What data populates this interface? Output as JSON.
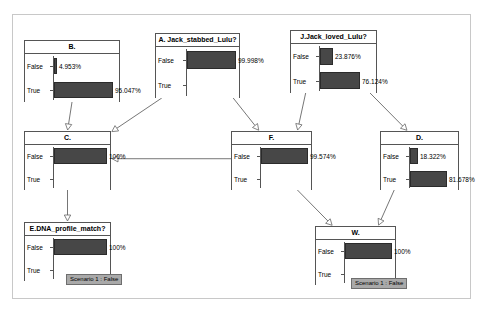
{
  "diagram": {
    "type": "bayesian-network",
    "title": "",
    "row_labels": [
      "False",
      "True"
    ],
    "bar_color": "#474747",
    "edge_color": "#666666",
    "frame_color": "#c8c8c8"
  },
  "nodes": [
    {
      "id": "B",
      "title": "B.",
      "x": 24,
      "y": 40,
      "w": 96,
      "h": 62,
      "axis_x": 28,
      "states": [
        {
          "label": "False",
          "value": 4.953,
          "value_text": "4.953%"
        },
        {
          "label": "True",
          "value": 95.047,
          "value_text": "95.047%"
        }
      ],
      "badge": null
    },
    {
      "id": "A",
      "title": "A. Jack_stabbed_Lulu?",
      "x": 155,
      "y": 33,
      "w": 85,
      "h": 65,
      "axis_x": 30,
      "states": [
        {
          "label": "False",
          "value": 99.998,
          "value_text": "99.998%"
        },
        {
          "label": "True",
          "value": 0.002,
          "value_text": ""
        }
      ],
      "badge": null
    },
    {
      "id": "J",
      "title": "J.Jack_loved_Lulu?",
      "x": 290,
      "y": 30,
      "w": 87,
      "h": 63,
      "axis_x": 28,
      "states": [
        {
          "label": "False",
          "value": 23.876,
          "value_text": "23.876%"
        },
        {
          "label": "True",
          "value": 76.124,
          "value_text": "76.124%"
        }
      ],
      "badge": null
    },
    {
      "id": "C",
      "title": "C.",
      "x": 24,
      "y": 131,
      "w": 87,
      "h": 59,
      "axis_x": 28,
      "states": [
        {
          "label": "False",
          "value": 100,
          "value_text": "100%"
        },
        {
          "label": "True",
          "value": 0,
          "value_text": ""
        }
      ],
      "badge": null
    },
    {
      "id": "F",
      "title": "F.",
      "x": 231,
      "y": 131,
      "w": 81,
      "h": 59,
      "axis_x": 28,
      "states": [
        {
          "label": "False",
          "value": 99.574,
          "value_text": "99.574%"
        },
        {
          "label": "True",
          "value": 0.426,
          "value_text": ""
        }
      ],
      "badge": null
    },
    {
      "id": "D",
      "title": "D.",
      "x": 380,
      "y": 131,
      "w": 79,
      "h": 59,
      "axis_x": 28,
      "states": [
        {
          "label": "False",
          "value": 18.322,
          "value_text": "18.322%"
        },
        {
          "label": "True",
          "value": 81.678,
          "value_text": "81.678%"
        }
      ],
      "badge": null
    },
    {
      "id": "E",
      "title": "E.DNA_profile_match?",
      "x": 24,
      "y": 222,
      "w": 87,
      "h": 59,
      "axis_x": 28,
      "states": [
        {
          "label": "False",
          "value": 100,
          "value_text": "100%"
        },
        {
          "label": "True",
          "value": 0,
          "value_text": ""
        }
      ],
      "badge": {
        "text": "Scenario 1 : False",
        "x": 42,
        "y": 52
      }
    },
    {
      "id": "W",
      "title": "W.",
      "x": 315,
      "y": 226,
      "w": 81,
      "h": 59,
      "axis_x": 28,
      "states": [
        {
          "label": "False",
          "value": 100,
          "value_text": "100%"
        },
        {
          "label": "True",
          "value": 0,
          "value_text": ""
        }
      ],
      "badge": {
        "text": "Scenario 1 : False",
        "x": 36,
        "y": 52
      }
    }
  ],
  "edges": [
    {
      "from": "B",
      "to": "C",
      "label": ""
    },
    {
      "from": "A",
      "to": "C",
      "label": ""
    },
    {
      "from": "A",
      "to": "F",
      "label": ""
    },
    {
      "from": "J",
      "to": "F",
      "label": ""
    },
    {
      "from": "J",
      "to": "D",
      "label": ""
    },
    {
      "from": "F",
      "to": "C",
      "label": ""
    },
    {
      "from": "C",
      "to": "E",
      "label": ""
    },
    {
      "from": "F",
      "to": "W",
      "label": ""
    },
    {
      "from": "D",
      "to": "W",
      "label": ""
    }
  ]
}
